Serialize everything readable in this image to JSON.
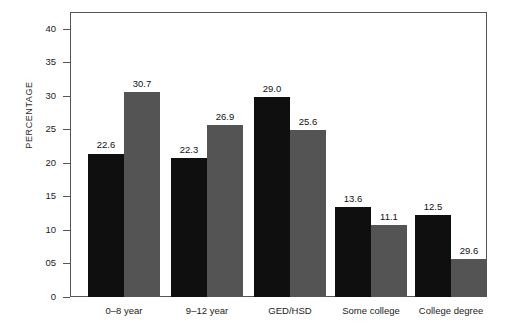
{
  "chart_data": {
    "type": "bar",
    "title": "",
    "xlabel": "",
    "ylabel": "PERCENTAGE",
    "categories": [
      "0–8 year",
      "9–12 year",
      "GED/HSD",
      "Some college",
      "College degree"
    ],
    "series": [
      {
        "name": "series-1",
        "color": "#100f10",
        "values": [
          22.6,
          22.3,
          29.0,
          13.6,
          12.5
        ],
        "labels": [
          "22.6",
          "22.3",
          "29.0",
          "13.6",
          "12.5"
        ],
        "drawn_values": [
          21.4,
          20.7,
          29.8,
          13.4,
          12.2
        ]
      },
      {
        "name": "series-2",
        "color": "#545454",
        "values": [
          30.7,
          26.9,
          25.6,
          11.1,
          29.6
        ],
        "labels": [
          "30.7",
          "26.9",
          "25.6",
          "11.1",
          "29.6"
        ],
        "drawn_values": [
          30.5,
          25.7,
          24.9,
          10.8,
          5.6
        ]
      }
    ],
    "ylim": [
      0,
      42.5
    ],
    "yticks": [
      0,
      5,
      10,
      15,
      20,
      25,
      30,
      35,
      40
    ],
    "ytick_labels": [
      "0",
      "05",
      "10",
      "15",
      "20",
      "25",
      "30",
      "35",
      "40"
    ],
    "grid": false,
    "legend": "none",
    "frame": true
  },
  "axes": {
    "y_title": "PERCENTAGE"
  }
}
